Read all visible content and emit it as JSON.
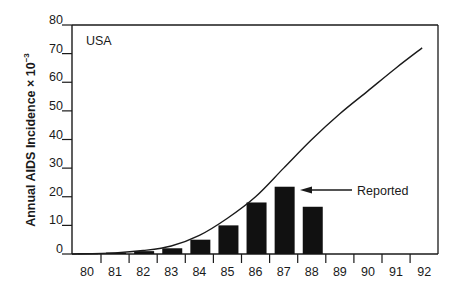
{
  "chart_data": {
    "type": "bar",
    "title": "",
    "annotation_region": "USA",
    "xlabel": "",
    "ylabel": "Annual AIDS Incidence × 10⁻³",
    "ylabel_base": "Annual AIDS Incidence × 10",
    "ylabel_exp": "−3",
    "ylim": [
      0,
      80
    ],
    "yticks": [
      0,
      10,
      20,
      30,
      40,
      50,
      60,
      70,
      80
    ],
    "categories": [
      "80",
      "81",
      "82",
      "83",
      "84",
      "85",
      "86",
      "87",
      "88",
      "89",
      "90",
      "91",
      "92"
    ],
    "grid": false,
    "series": [
      {
        "name": "Reported",
        "type": "bar",
        "values": [
          0.2,
          0.5,
          1.0,
          2.0,
          5.0,
          10.0,
          18.0,
          23.5,
          16.5,
          null,
          null,
          null,
          null
        ]
      },
      {
        "name": "Projected",
        "type": "line",
        "values": [
          0,
          0.4,
          1.2,
          2.8,
          6.5,
          12.5,
          20,
          30,
          40,
          49,
          57,
          65,
          72
        ]
      }
    ],
    "annotations": [
      {
        "text": "Reported",
        "arrow_to": "87",
        "y": 22.5
      },
      {
        "text": "USA",
        "position": "top-left"
      }
    ]
  }
}
